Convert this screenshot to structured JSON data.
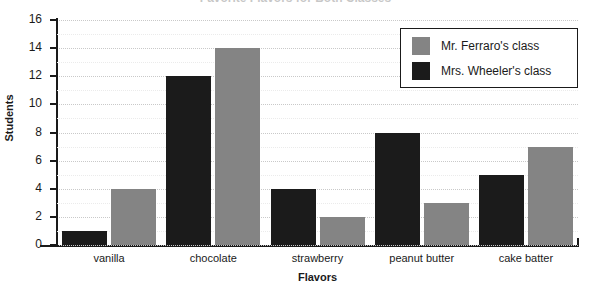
{
  "chart_data": {
    "type": "bar",
    "title": "Favorite Flavors for Both Classes",
    "xlabel": "Flavors",
    "ylabel": "Students",
    "categories": [
      "vanilla",
      "chocolate",
      "strawberry",
      "peanut butter",
      "cake batter"
    ],
    "series": [
      {
        "name": "Mrs. Wheeler's class",
        "color": "#1b1b1b",
        "values": [
          1,
          12,
          4,
          8,
          5
        ]
      },
      {
        "name": "Mr. Ferraro's class",
        "color": "#848484",
        "values": [
          4,
          14,
          2,
          3,
          7
        ]
      }
    ],
    "ylim": [
      0,
      16
    ],
    "ytick_step": 2,
    "yticks": [
      0,
      2,
      4,
      6,
      8,
      10,
      12,
      14,
      16
    ],
    "ytick_labels": [
      "0",
      "2",
      "4",
      "6",
      "8",
      "10",
      "12",
      "14",
      "16"
    ],
    "grid": true,
    "grid_minor": true,
    "legend_position": "top-right",
    "legend_order": [
      "Mr. Ferraro's class",
      "Mrs. Wheeler's class"
    ],
    "bar_order_in_group": [
      "Mrs. Wheeler's class",
      "Mr. Ferraro's class"
    ]
  }
}
